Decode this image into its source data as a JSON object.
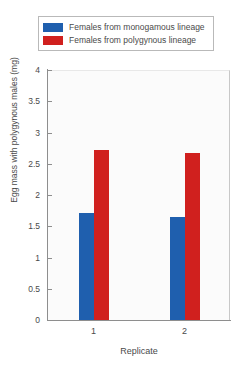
{
  "chart_data": {
    "type": "bar",
    "title": "",
    "xlabel": "Replicate",
    "ylabel": "Egg mass with polygynous males (mg)",
    "categories": [
      "1",
      "2"
    ],
    "series": [
      {
        "name": "Females from monogamous lineage",
        "color": "#1F5FAE",
        "values": [
          1.71,
          1.65
        ]
      },
      {
        "name": "Females from polygynous lineage",
        "color": "#D0201E",
        "values": [
          2.72,
          2.67
        ]
      }
    ],
    "ylim": [
      0,
      4
    ],
    "yticks": [
      "0",
      "0.5",
      "1",
      "1.5",
      "2",
      "2.5",
      "3",
      "3.5",
      "4"
    ],
    "ytick_values": [
      0,
      0.5,
      1,
      1.5,
      2,
      2.5,
      3,
      3.5,
      4
    ],
    "grid": false,
    "legend_position": "top"
  },
  "legend": {
    "entries": [
      {
        "label": "Females from monogamous lineage",
        "color": "#1F5FAE"
      },
      {
        "label": "Females from polygynous lineage",
        "color": "#D0201E"
      }
    ]
  }
}
